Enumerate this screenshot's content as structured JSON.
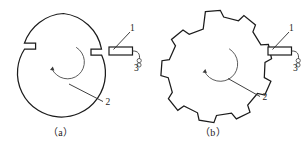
{
  "figure": {
    "background_color": "#ffffff",
    "line_color": "#1b1b1b",
    "accent_color": "#4a4a4a",
    "width": 304,
    "height": 145
  },
  "panels": [
    {
      "id": "a",
      "caption": "（a）",
      "body_type": "slotted-disc",
      "body_description": "circular disc with two rectangular radial slots",
      "slot_count": 2,
      "labels": [
        {
          "key": "sensor",
          "text": "1"
        },
        {
          "key": "rotating-body",
          "text": "2"
        },
        {
          "key": "lead-wire",
          "text": "3"
        }
      ],
      "rotation_direction": "counterclockwise"
    },
    {
      "id": "b",
      "caption": "（b）",
      "body_type": "gear-wheel",
      "body_description": "toothed gear wheel",
      "tooth_count": 9,
      "labels": [
        {
          "key": "sensor",
          "text": "1"
        },
        {
          "key": "rotating-body",
          "text": "2"
        },
        {
          "key": "lead-wire",
          "text": "3"
        }
      ],
      "rotation_direction": "counterclockwise"
    }
  ]
}
